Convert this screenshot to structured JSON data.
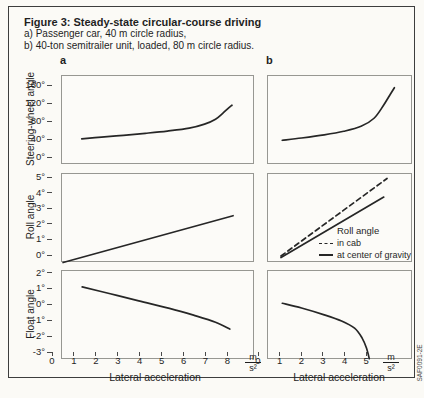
{
  "figure": {
    "title": "Figure 3: Steady-state circular-course driving",
    "subtitle_a": "a) Passenger car, 40 m circle radius,",
    "subtitle_b": "b) 40-ton semitrailer unit, loaded, 80 m circle radius.",
    "column_label_a": "a",
    "column_label_b": "b",
    "watermark_code": "SAF0091-2E",
    "colors": {
      "curve": "#262626",
      "box_border": "#979792",
      "frame_border": "#3d3d3d",
      "paper": "#fbfaf6",
      "text": "#1f1f1f"
    }
  },
  "chart_data": {
    "type": "line",
    "xlabel": "Lateral acceleration",
    "x_unit": {
      "numerator": "m",
      "denominator": "s²"
    },
    "columns": [
      {
        "id": "a",
        "xlim": [
          0,
          8.8
        ],
        "xticks": [
          0,
          1,
          2,
          3,
          4,
          5,
          6,
          7,
          8
        ]
      },
      {
        "id": "b",
        "xlim": [
          0,
          6.7
        ],
        "xticks": [
          0,
          1,
          2,
          3,
          4,
          5
        ]
      }
    ],
    "rows": [
      {
        "ylabel": "Steering-wheel angle",
        "ylim": [
          0,
          198
        ],
        "yticks": [
          {
            "v": 160,
            "t": "160°"
          },
          {
            "v": 120,
            "t": "120°"
          },
          {
            "v": 80,
            "t": "80°"
          },
          {
            "v": 40,
            "t": "40°"
          },
          {
            "v": 0,
            "t": "0°"
          }
        ]
      },
      {
        "ylabel": "Roll angle",
        "ylim": [
          0,
          5.74
        ],
        "yticks": [
          {
            "v": 5,
            "t": "5°"
          },
          {
            "v": 4,
            "t": "4°"
          },
          {
            "v": 3,
            "t": "3°"
          },
          {
            "v": 2,
            "t": "2°"
          },
          {
            "v": 1,
            "t": "1°"
          },
          {
            "v": 0,
            "t": "0°"
          }
        ]
      },
      {
        "ylabel": "Float angle",
        "ylim": [
          -3,
          2.6
        ],
        "yticks": [
          {
            "v": 2,
            "t": "2°"
          },
          {
            "v": 1,
            "t": "1°"
          },
          {
            "v": 0,
            "t": "0°"
          },
          {
            "v": -1,
            "t": "-1°"
          },
          {
            "v": -2,
            "t": "-2°"
          },
          {
            "v": -3,
            "t": "-3°"
          }
        ]
      }
    ],
    "plots": [
      {
        "id": "steering-car",
        "col": "a",
        "row": 0,
        "series": [
          {
            "name": "steering-wheel angle, passenger car",
            "style": "solid",
            "points": [
              [
                0.9,
                58
              ],
              [
                1.8,
                62
              ],
              [
                2.8,
                66
              ],
              [
                3.8,
                70.5
              ],
              [
                4.8,
                75.5
              ],
              [
                5.8,
                82
              ],
              [
                6.5,
                91
              ],
              [
                7.0,
                102
              ],
              [
                7.35,
                116
              ],
              [
                7.6,
                127
              ],
              [
                7.75,
                133
              ]
            ]
          }
        ]
      },
      {
        "id": "steering-truck",
        "col": "b",
        "row": 0,
        "series": [
          {
            "name": "steering-wheel angle, semitrailer",
            "style": "solid",
            "points": [
              [
                0.66,
                55
              ],
              [
                1.55,
                60
              ],
              [
                2.6,
                67
              ],
              [
                3.5,
                75
              ],
              [
                4.3,
                86
              ],
              [
                4.9,
                104
              ],
              [
                5.34,
                133
              ],
              [
                5.66,
                158
              ],
              [
                5.84,
                172
              ]
            ]
          }
        ]
      },
      {
        "id": "roll-car",
        "col": "a",
        "row": 1,
        "series": [
          {
            "name": "roll angle, passenger car",
            "style": "solid",
            "points": [
              [
                0.05,
                0.03
              ],
              [
                7.8,
                3.05
              ]
            ]
          }
        ]
      },
      {
        "id": "roll-truck",
        "col": "b",
        "row": 1,
        "series": [
          {
            "name": "in cab",
            "style": "dashed",
            "points": [
              [
                0.6,
                0.45
              ],
              [
                5.5,
                5.45
              ]
            ]
          },
          {
            "name": "at center of gravity",
            "style": "solid",
            "points": [
              [
                0.6,
                0.35
              ],
              [
                5.35,
                4.25
              ]
            ]
          }
        ]
      },
      {
        "id": "float-car",
        "col": "a",
        "row": 2,
        "series": [
          {
            "name": "float angle, passenger car",
            "style": "solid",
            "points": [
              [
                0.92,
                1.6
              ],
              [
                2.2,
                1.17
              ],
              [
                3.5,
                0.72
              ],
              [
                4.9,
                0.25
              ],
              [
                6.0,
                -0.18
              ],
              [
                7.0,
                -0.62
              ],
              [
                7.65,
                -1.05
              ]
            ]
          }
        ]
      },
      {
        "id": "float-truck",
        "col": "b",
        "row": 2,
        "series": [
          {
            "name": "float angle, semitrailer",
            "style": "solid",
            "points": [
              [
                0.66,
                0.57
              ],
              [
                1.55,
                0.27
              ],
              [
                2.6,
                -0.16
              ],
              [
                3.4,
                -0.55
              ],
              [
                4.0,
                -1.0
              ],
              [
                4.35,
                -1.62
              ],
              [
                4.55,
                -2.25
              ],
              [
                4.68,
                -2.92
              ]
            ]
          }
        ]
      }
    ],
    "legend": {
      "title": "Roll angle",
      "entries": [
        {
          "style": "dashed",
          "label": "in cab"
        },
        {
          "style": "solid",
          "label": "at center of gravity"
        }
      ]
    }
  }
}
